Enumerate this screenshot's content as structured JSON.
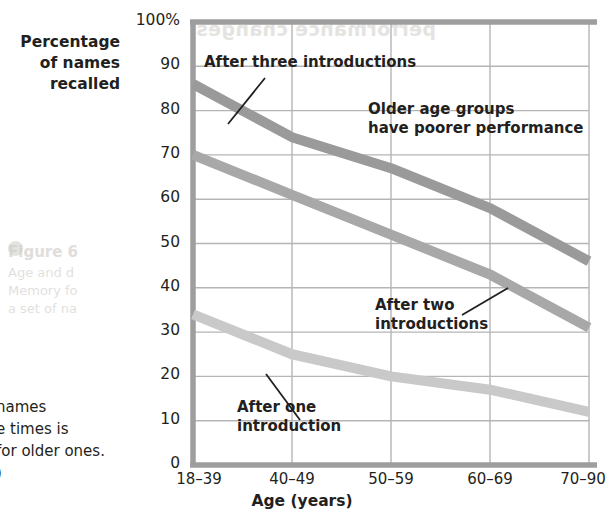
{
  "chart_data": {
    "type": "line",
    "title": "",
    "xlabel": "Age (years)",
    "ylabel": "Percentage of names recalled",
    "categories": [
      "18–39",
      "40–49",
      "50–59",
      "60–69",
      "70–90"
    ],
    "ylim": [
      0,
      100
    ],
    "ytick_labels": [
      "100%",
      "90",
      "80",
      "70",
      "60",
      "50",
      "40",
      "30",
      "20",
      "10",
      "0"
    ],
    "ytick_values": [
      100,
      90,
      80,
      70,
      60,
      50,
      40,
      30,
      20,
      10,
      0
    ],
    "grid": true,
    "legend": "none (inline annotations)",
    "series": [
      {
        "name": "After three introductions",
        "values": [
          86,
          74,
          67,
          58,
          46
        ],
        "color": "#9a9a9a"
      },
      {
        "name": "After two introductions",
        "values": [
          70,
          61,
          52,
          43,
          31
        ],
        "color": "#a8a8a8"
      },
      {
        "name": "After one introduction",
        "values": [
          34,
          25,
          20,
          17,
          12
        ],
        "color": "#c9c9c9"
      }
    ],
    "annotations": [
      {
        "id": "after-three",
        "text_lines": [
          "After three introductions"
        ],
        "points_to_series": "After three introductions"
      },
      {
        "id": "older-age-groups",
        "text_lines": [
          "Older age groups",
          "have poorer performance"
        ],
        "points_to_series": ""
      },
      {
        "id": "after-two",
        "text_lines": [
          "After two introductions"
        ],
        "points_to_series": "After two introductions"
      },
      {
        "id": "after-one",
        "text_lines": [
          "After one introduction"
        ],
        "points_to_series": "After one introduction"
      }
    ]
  },
  "axes": {
    "y_title_lines": [
      "Percentage",
      "of names",
      "recalled"
    ],
    "y_ticks": [
      "100%",
      "90",
      "80",
      "70",
      "60",
      "50",
      "40",
      "30",
      "20",
      "10",
      "0"
    ],
    "x_ticks": [
      "18–39",
      "40–49",
      "50–59",
      "60–69",
      "70–90"
    ],
    "x_title": "Age (years)"
  },
  "annotations": {
    "after_three": "After three introductions",
    "older_line1": "Older age groups",
    "older_line2": "have poorer performance",
    "after_two_line1": "After two",
    "after_two_line2": "introductions",
    "after_one_line1": "After one",
    "after_one_line2": "introduction"
  },
  "caption": {
    "line1": " names",
    "line2": "e times is",
    "line3": "for older ones.",
    "line4": ")"
  },
  "ghost_text": {
    "top_bleed": "performance changes",
    "figure_label": "Figure 6",
    "bleed_line1": "Age and d",
    "bleed_line2": "Memory fo",
    "bleed_line3": "a set of na"
  },
  "colors": {
    "line_three": "#9a9a9a",
    "line_two": "#a8a8a8",
    "line_one": "#c9c9c9",
    "grid": "#b5b5b5",
    "frame": "#9e9e9e",
    "text": "#231f20",
    "ghost": "#cfcdc9"
  }
}
